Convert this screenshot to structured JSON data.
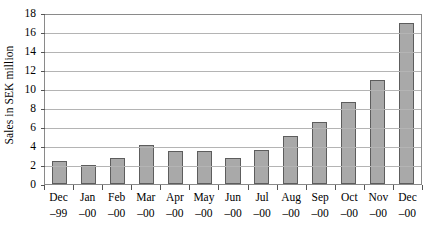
{
  "chart_data": {
    "type": "bar",
    "title": "",
    "xlabel": "",
    "ylabel": "Sales in SEK million",
    "ylim": [
      0,
      18
    ],
    "ytick_step": 2,
    "yticks": [
      18,
      16,
      14,
      12,
      10,
      8,
      6,
      4,
      2,
      0
    ],
    "grid": true,
    "legend": false,
    "categories": [
      "Dec –99",
      "Jan –00",
      "Feb –00",
      "Mar –00",
      "Apr –00",
      "May –00",
      "Jun –00",
      "Jul –00",
      "Aug –00",
      "Sep –00",
      "Oct –00",
      "Nov –00",
      "Dec –00"
    ],
    "category_parts": [
      {
        "month": "Dec",
        "year": "–99"
      },
      {
        "month": "Jan",
        "year": "–00"
      },
      {
        "month": "Feb",
        "year": "–00"
      },
      {
        "month": "Mar",
        "year": "–00"
      },
      {
        "month": "Apr",
        "year": "–00"
      },
      {
        "month": "May",
        "year": "–00"
      },
      {
        "month": "Jun",
        "year": "–00"
      },
      {
        "month": "Jul",
        "year": "–00"
      },
      {
        "month": "Aug",
        "year": "–00"
      },
      {
        "month": "Sep",
        "year": "–00"
      },
      {
        "month": "Oct",
        "year": "–00"
      },
      {
        "month": "Nov",
        "year": "–00"
      },
      {
        "month": "Dec",
        "year": "–00"
      }
    ],
    "values": [
      2.4,
      2.0,
      2.7,
      4.1,
      3.5,
      3.5,
      2.7,
      3.6,
      5.1,
      6.5,
      8.6,
      11.0,
      16.9
    ]
  },
  "style": {
    "bar_fill": "#a9a9a9",
    "bar_border": "#5d5d5d",
    "gridline_color": "#b4b4b4",
    "frame_color": "#8a8a8a",
    "background": "#ffffff",
    "text_color": "#000000"
  }
}
